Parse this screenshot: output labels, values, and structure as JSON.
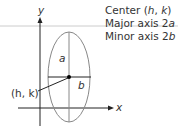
{
  "legend": {
    "center_prefix": "Center (",
    "center_h": "h",
    "center_sep": ", ",
    "center_k": "k",
    "center_suffix": ")",
    "major_prefix": "Major axis 2",
    "major_var": "a",
    "minor_prefix": "Minor axis 2",
    "minor_var": "b"
  },
  "axes": {
    "x_label": "x",
    "y_label": "y"
  },
  "labels": {
    "semi_major": "a",
    "semi_minor": "b",
    "center_point": "(h, k)"
  },
  "colors": {
    "axis": "#222222",
    "ellipse": "#888888",
    "rule": "#cccccc",
    "text": "#333333"
  }
}
